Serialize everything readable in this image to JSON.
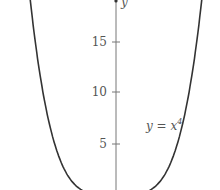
{
  "chart_data": {
    "type": "line",
    "title": "",
    "xlabel": "",
    "ylabel": "y",
    "series": [
      {
        "name": "y = x^4",
        "function": "x^4",
        "x_range": [
          -2.15,
          2.15
        ]
      }
    ],
    "y_ticks": [
      5,
      10,
      15
    ],
    "ylim": [
      0,
      20
    ],
    "grid": false,
    "legend": "none",
    "annotations": [
      {
        "text": "y = x",
        "superscript": "4",
        "near_y": 6.5
      }
    ]
  },
  "axis": {
    "y_label": "y",
    "ticks": [
      "5",
      "10",
      "15"
    ]
  },
  "curve_label": {
    "base": "y = x",
    "sup": "4"
  },
  "colors": {
    "curve": "#333333",
    "axis": "#666666",
    "text": "#555555"
  }
}
